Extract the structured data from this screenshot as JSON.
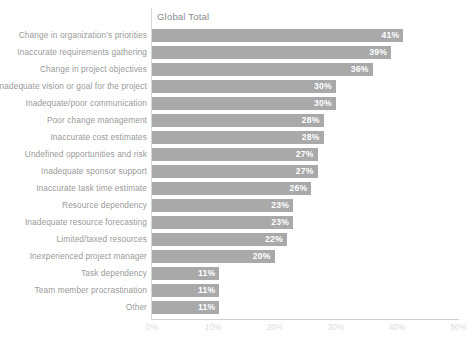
{
  "chart_data": {
    "type": "bar",
    "orientation": "horizontal",
    "title": "",
    "series_header": "Global Total",
    "xlabel": "",
    "ylabel": "",
    "xlim": [
      0,
      50
    ],
    "xticks": [
      "0%",
      "10%",
      "20%",
      "30%",
      "40%",
      "50%"
    ],
    "xtick_values": [
      0,
      10,
      20,
      30,
      40,
      50
    ],
    "grid": false,
    "value_suffix": "%",
    "bar_color": "#a9a9a9",
    "value_label_color": "#ffffff",
    "category_label_color": "#9a9a9a",
    "axis_label_color": "#dcdcdc",
    "categories": [
      "Change in organization's priorities",
      "Inaccurate requirements gathering",
      "Change in project objectives",
      "Inadequate vision or goal for the project",
      "Inadequate/poor communication",
      "Poor change management",
      "Inaccurate cost estimates",
      "Undefined opportunities and risk",
      "Inadequate sponsor support",
      "Inaccurate task time estimate",
      "Resource dependency",
      "Inadequate resource forecasting",
      "Limited/taxed resources",
      "Inexperienced project manager",
      "Task dependency",
      "Team member procrastination",
      "Other"
    ],
    "values": [
      41,
      39,
      36,
      30,
      30,
      28,
      28,
      27,
      27,
      26,
      23,
      23,
      22,
      20,
      11,
      11,
      11
    ],
    "value_labels": [
      "41%",
      "39%",
      "36%",
      "30%",
      "30%",
      "28%",
      "28%",
      "27%",
      "27%",
      "26%",
      "23%",
      "23%",
      "22%",
      "20%",
      "11%",
      "11%",
      "11%"
    ]
  }
}
